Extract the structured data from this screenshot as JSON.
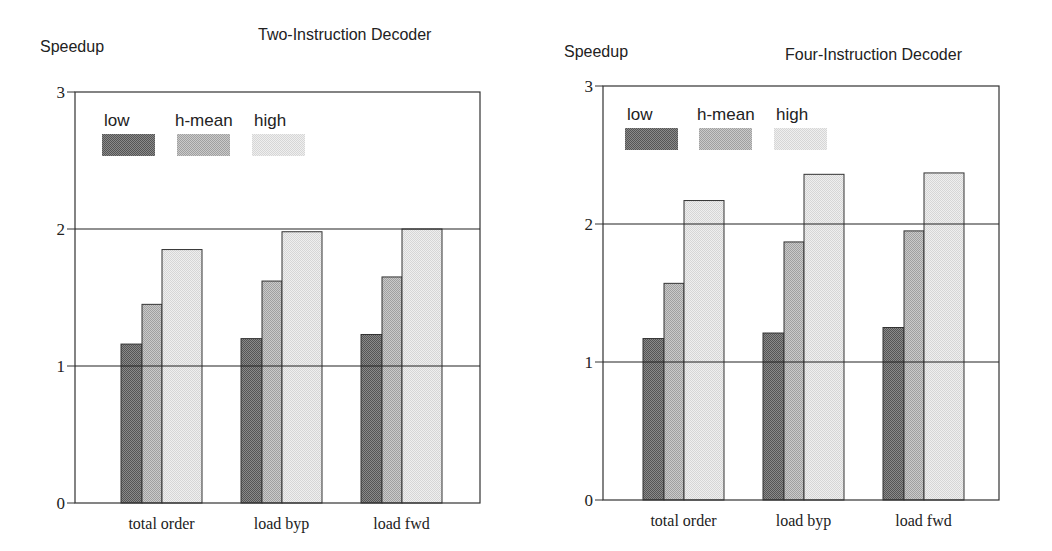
{
  "chart_data": [
    {
      "type": "bar",
      "title": "Two-Instruction Decoder",
      "ylabel": "Speedup",
      "xlabel": "",
      "ylim": [
        0,
        3
      ],
      "yticks": [
        0,
        1,
        2,
        3
      ],
      "grid": {
        "horizontal_lines_at": [
          1,
          2
        ]
      },
      "legend": {
        "position": "upper-left-inside",
        "entries": [
          "low",
          "h-mean",
          "high"
        ]
      },
      "categories": [
        "total order",
        "load byp",
        "load fwd"
      ],
      "series": [
        {
          "name": "low",
          "values": [
            1.16,
            1.2,
            1.23
          ],
          "color": "#707070"
        },
        {
          "name": "h-mean",
          "values": [
            1.45,
            1.62,
            1.65
          ],
          "color": "#b5b5b5"
        },
        {
          "name": "high",
          "values": [
            1.85,
            1.98,
            2.0
          ],
          "color": "#e3e3e3"
        }
      ]
    },
    {
      "type": "bar",
      "title": "Four-Instruction Decoder",
      "ylabel": "Speedup",
      "xlabel": "",
      "ylim": [
        0,
        3
      ],
      "yticks": [
        0,
        1,
        2,
        3
      ],
      "grid": {
        "horizontal_lines_at": [
          1,
          2
        ]
      },
      "legend": {
        "position": "upper-left-inside",
        "entries": [
          "low",
          "h-mean",
          "high"
        ]
      },
      "categories": [
        "total order",
        "load byp",
        "load fwd"
      ],
      "series": [
        {
          "name": "low",
          "values": [
            1.17,
            1.21,
            1.25
          ],
          "color": "#707070"
        },
        {
          "name": "h-mean",
          "values": [
            1.57,
            1.87,
            1.95
          ],
          "color": "#b5b5b5"
        },
        {
          "name": "high",
          "values": [
            2.17,
            2.36,
            2.37
          ],
          "color": "#e3e3e3"
        }
      ]
    }
  ],
  "layout": [
    {
      "left": 0,
      "plot": {
        "x0": 75,
        "x1": 480,
        "yTop": 92,
        "yBottom": 503
      },
      "ylabelPos": [
        40,
        44
      ],
      "titlePos": [
        258,
        18
      ],
      "groupStarts": [
        121,
        241,
        361
      ],
      "legendX": [
        102,
        177,
        252
      ],
      "legendY": 134
    },
    {
      "left": 0,
      "plot": {
        "x0": 603,
        "x1": 999,
        "yTop": 86,
        "yBottom": 500
      },
      "ylabelPos": [
        564,
        49
      ],
      "titlePos": [
        785,
        38
      ],
      "groupStarts": [
        643,
        763,
        883
      ],
      "legendX": [
        625,
        699,
        774
      ],
      "legendY": 128
    }
  ]
}
